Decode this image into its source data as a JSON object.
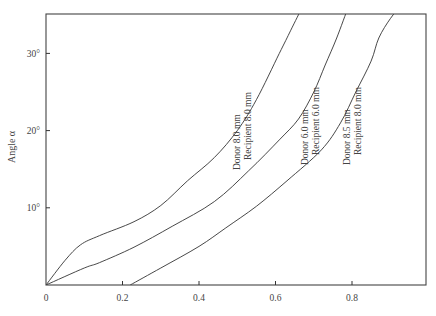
{
  "chart_data": {
    "type": "line",
    "title": "",
    "xlabel": "",
    "ylabel": "Angle α",
    "xlim": [
      0,
      1.0
    ],
    "ylim": [
      0,
      35
    ],
    "grid": false,
    "legend": "inline curve labels",
    "x_ticks": [
      {
        "value": 0,
        "label": "0"
      },
      {
        "value": 0.2,
        "label": "0.2"
      },
      {
        "value": 0.4,
        "label": "0.4"
      },
      {
        "value": 0.6,
        "label": "0.6"
      },
      {
        "value": 0.8,
        "label": "0.8"
      }
    ],
    "y_ticks": [
      {
        "value": 10,
        "label": "10°"
      },
      {
        "value": 20,
        "label": "20°"
      },
      {
        "value": 30,
        "label": "30°"
      }
    ],
    "series": [
      {
        "name": "Donor 8.0 mm / Recipient 8.0 mm",
        "label_line1": "Donor 8.0 mm",
        "label_line2": "Recipient 8.0 mm",
        "points": [
          [
            0,
            0
          ],
          [
            0.05,
            3.2
          ],
          [
            0.09,
            5.2
          ],
          [
            0.14,
            6.4
          ],
          [
            0.23,
            8.2
          ],
          [
            0.3,
            10.3
          ],
          [
            0.37,
            13.5
          ],
          [
            0.44,
            16.5
          ],
          [
            0.5,
            20.0
          ],
          [
            0.55,
            24.0
          ],
          [
            0.61,
            30.0
          ],
          [
            0.64,
            33.0
          ],
          [
            0.67,
            36.0
          ]
        ]
      },
      {
        "name": "Donor 6.0 mm / Recipient 6.0 mm",
        "label_line1": "Donor 6.0 mm",
        "label_line2": "Recipient 6.0 mm",
        "points": [
          [
            0,
            0
          ],
          [
            0.1,
            2.2
          ],
          [
            0.14,
            2.9
          ],
          [
            0.23,
            4.9
          ],
          [
            0.33,
            7.6
          ],
          [
            0.44,
            10.8
          ],
          [
            0.53,
            14.8
          ],
          [
            0.61,
            18.8
          ],
          [
            0.66,
            21.5
          ],
          [
            0.7,
            25.0
          ],
          [
            0.73,
            28.5
          ],
          [
            0.76,
            32.0
          ],
          [
            0.79,
            36.0
          ]
        ]
      },
      {
        "name": "Donor 8.5 mm / Recipient 8.0 mm",
        "label_line1": "Donor 8.5 mm",
        "label_line2": "Recipient 8.0 mm",
        "points": [
          [
            0.22,
            0
          ],
          [
            0.3,
            2.2
          ],
          [
            0.4,
            5.0
          ],
          [
            0.47,
            7.4
          ],
          [
            0.55,
            10.2
          ],
          [
            0.63,
            13.5
          ],
          [
            0.72,
            17.5
          ],
          [
            0.77,
            21.0
          ],
          [
            0.81,
            25.0
          ],
          [
            0.85,
            29.0
          ],
          [
            0.87,
            32.0
          ],
          [
            0.9,
            34.5
          ],
          [
            0.925,
            36.0
          ]
        ]
      }
    ]
  }
}
